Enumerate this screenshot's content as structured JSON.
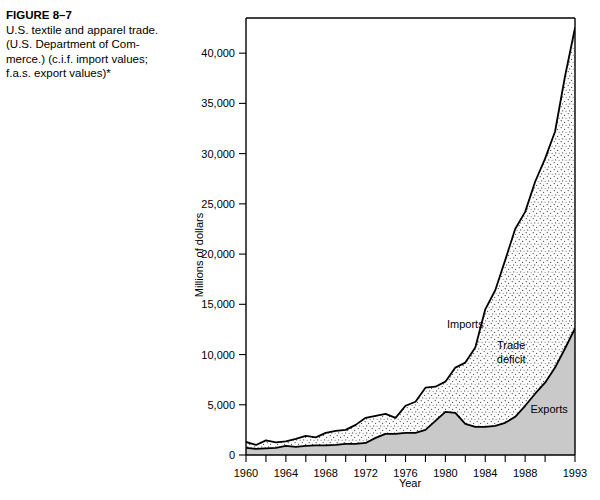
{
  "caption": {
    "figure_label": "FIGURE 8–7",
    "line1": "U.S. textile and apparel trade.",
    "line2": "(U.S. Department of Com-",
    "line3": "merce.) (c.i.f. import values;",
    "line4": "f.a.s. export values)*"
  },
  "chart_data": {
    "type": "area",
    "title": "",
    "xlabel": "Year",
    "ylabel": "Millions of dollars",
    "xlim": [
      1960,
      1993
    ],
    "ylim": [
      0,
      43500
    ],
    "grid": false,
    "legend_position": "inline-annotations",
    "y_ticks": [
      0,
      5000,
      10000,
      15000,
      20000,
      25000,
      30000,
      35000,
      40000
    ],
    "y_tick_labels": [
      "0",
      "5,000",
      "10,000",
      "15,000",
      "20,000",
      "25,000",
      "30,000",
      "35,000",
      "40,000"
    ],
    "x_ticks": [
      1960,
      1962,
      1964,
      1966,
      1968,
      1970,
      1972,
      1974,
      1976,
      1978,
      1980,
      1982,
      1984,
      1986,
      1988,
      1990,
      1993
    ],
    "x_tick_labels": [
      "1960",
      "1964",
      "1968",
      "1972",
      "1976",
      "1980",
      "1984",
      "1988",
      "1993"
    ],
    "x_labeled_ticks": [
      1960,
      1964,
      1968,
      1972,
      1976,
      1980,
      1984,
      1988,
      1993
    ],
    "annotations": [
      {
        "text": "Imports",
        "x": 1982,
        "y": 12600
      },
      {
        "text": "Trade",
        "x": 1986.6,
        "y": 10600
      },
      {
        "text": "deficit",
        "x": 1986.6,
        "y": 9200
      },
      {
        "text": "Exports",
        "x": 1990.4,
        "y": 4200
      }
    ],
    "x": [
      1960,
      1961,
      1962,
      1963,
      1964,
      1965,
      1966,
      1967,
      1968,
      1969,
      1970,
      1971,
      1972,
      1973,
      1974,
      1975,
      1976,
      1977,
      1978,
      1979,
      1980,
      1981,
      1982,
      1983,
      1984,
      1985,
      1986,
      1987,
      1988,
      1989,
      1990,
      1991,
      1992,
      1993
    ],
    "series": [
      {
        "name": "Imports",
        "color": "#000000",
        "values": [
          1300,
          1000,
          1450,
          1250,
          1350,
          1600,
          1900,
          1750,
          2200,
          2400,
          2500,
          3000,
          3700,
          3900,
          4100,
          3700,
          4900,
          5300,
          6700,
          6800,
          7300,
          8700,
          9200,
          10700,
          14500,
          16400,
          19400,
          22500,
          24200,
          27200,
          29500,
          32200,
          37700,
          42500
        ]
      },
      {
        "name": "Exports",
        "color": "#000000",
        "values": [
          700,
          600,
          650,
          700,
          900,
          800,
          900,
          950,
          950,
          1000,
          1100,
          1100,
          1200,
          1700,
          2100,
          2100,
          2200,
          2200,
          2500,
          3400,
          4300,
          4200,
          3100,
          2800,
          2800,
          2900,
          3200,
          3800,
          4900,
          6100,
          7200,
          8700,
          10600,
          12600
        ]
      }
    ]
  }
}
